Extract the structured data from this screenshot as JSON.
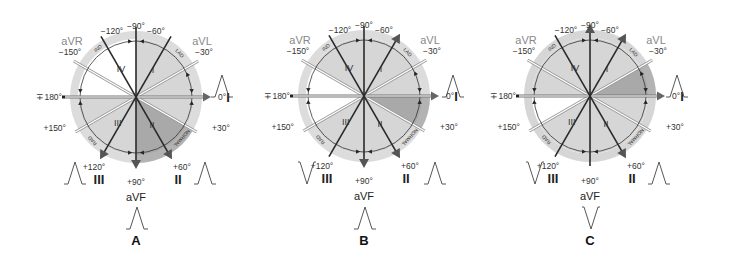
{
  "figure": {
    "panels": [
      {
        "id": "A",
        "letter": "A",
        "center": [
          136,
          97
        ],
        "highlight": {
          "from": 30,
          "to": 90,
          "color": "#a9a9a9"
        },
        "medium": [
          {
            "from": -90,
            "to": 30,
            "color": "#d6d6d6"
          },
          {
            "from": 90,
            "to": 180,
            "color": "#d6d6d6"
          }
        ],
        "white": [
          {
            "from": -180,
            "to": -90
          }
        ],
        "ring_color": "#dcdcdc",
        "leads": {
          "I": "up",
          "II": "up",
          "III": "up",
          "aVF": "up"
        },
        "waveforms": {
          "I": [
            215,
            95
          ],
          "II": [
            198,
            178
          ],
          "III": [
            68,
            178
          ],
          "aVF": [
            137,
            225
          ]
        },
        "heavy_arrows": [
          60,
          90,
          120
        ]
      },
      {
        "id": "B",
        "letter": "B",
        "center": [
          364,
          96
        ],
        "highlight": {
          "from": 0,
          "to": 30,
          "color": "#a9a9a9"
        },
        "medium": [
          {
            "from": -150,
            "to": 0,
            "color": "#d6d6d6"
          },
          {
            "from": 30,
            "to": 150,
            "color": "#d6d6d6"
          }
        ],
        "white": [
          {
            "from": 150,
            "to": 210
          }
        ],
        "ring_color": "#dcdcdc",
        "leads": {
          "I": "up",
          "II": "up",
          "III": "down",
          "aVF": "up"
        },
        "waveforms": {
          "I": [
            446,
            95
          ],
          "II": [
            428,
            178
          ],
          "III": [
            300,
            178
          ],
          "aVF": [
            365,
            225
          ]
        },
        "heavy_arrows": [
          -60,
          60,
          90
        ]
      },
      {
        "id": "C",
        "letter": "C",
        "center": [
          590,
          96
        ],
        "highlight": {
          "from": -30,
          "to": 0,
          "color": "#a9a9a9"
        },
        "medium": [
          {
            "from": -180,
            "to": -30,
            "color": "#d6d6d6"
          },
          {
            "from": 0,
            "to": 150,
            "color": "#d6d6d6"
          }
        ],
        "white": [
          {
            "from": 150,
            "to": 180
          }
        ],
        "ring_color": "#d6d6d6",
        "leads": {
          "I": "up",
          "II": "up",
          "III": "down",
          "aVF": "down"
        },
        "waveforms": {
          "I": [
            670,
            95
          ],
          "II": [
            652,
            178
          ],
          "III": [
            528,
            178
          ],
          "aVF": [
            591,
            225
          ]
        },
        "heavy_arrows": [
          -90,
          -60,
          60
        ]
      }
    ],
    "angle_labels": [
      {
        "deg": -90,
        "text": "−90°"
      },
      {
        "deg": -60,
        "text": "−60°"
      },
      {
        "deg": -120,
        "text": "−120°"
      },
      {
        "deg": -30,
        "text": "−30°"
      },
      {
        "deg": -150,
        "text": "−150°"
      },
      {
        "deg": 0,
        "text": "0°"
      },
      {
        "deg": 180,
        "text": "∓180°"
      },
      {
        "deg": 30,
        "text": "+30°"
      },
      {
        "deg": 150,
        "text": "+150°"
      },
      {
        "deg": 60,
        "text": "+60°"
      },
      {
        "deg": 120,
        "text": "+120°"
      },
      {
        "deg": 90,
        "text": "+90°"
      }
    ],
    "lead_names": {
      "aVR": "aVR",
      "aVL": "aVL",
      "aVF": "aVF",
      "I": "I",
      "II": "II",
      "III": "III"
    },
    "quadrants": {
      "I": "I",
      "II": "II",
      "III": "III",
      "IV": "IV"
    },
    "zones": {
      "lad": "LAD",
      "rad": "RAD",
      "ind": "IND",
      "normal": "NORMAL"
    },
    "colors": {
      "line": "#222222",
      "arrow_grey": "#555555",
      "aug_lead_text": "#8a8a8a",
      "highlight": "#a9a9a9",
      "medium": "#d6d6d6",
      "ring": "#dcdcdc"
    }
  }
}
